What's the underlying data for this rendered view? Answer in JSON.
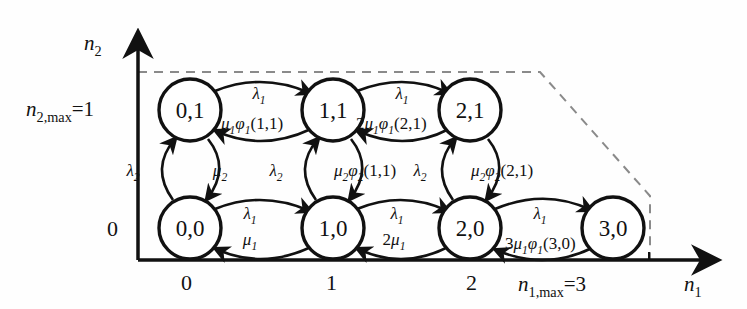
{
  "figure": {
    "type": "state-transition-diagram",
    "title": ""
  },
  "axes": {
    "x": {
      "name": "n1",
      "label": "n",
      "label_sub": "1",
      "ticks": [
        "0",
        "1",
        "2"
      ],
      "max_label_prefix": "n",
      "max_label_sub": "1,max",
      "max_label_value": "=3"
    },
    "y": {
      "name": "n2",
      "label": "n",
      "label_sub": "2",
      "ticks": [
        "0"
      ],
      "max_label_prefix": "n",
      "max_label_sub": "2,max",
      "max_label_value": "=1"
    }
  },
  "states": [
    {
      "id": "s00",
      "label": "0,0",
      "n1": 0,
      "n2": 0,
      "cx": 190,
      "cy": 228,
      "r": 31
    },
    {
      "id": "s10",
      "label": "1,0",
      "n1": 1,
      "n2": 0,
      "cx": 333,
      "cy": 228,
      "r": 31
    },
    {
      "id": "s20",
      "label": "2,0",
      "n1": 2,
      "n2": 0,
      "cx": 470,
      "cy": 228,
      "r": 31
    },
    {
      "id": "s30",
      "label": "3,0",
      "n1": 3,
      "n2": 0,
      "cx": 613,
      "cy": 228,
      "r": 31
    },
    {
      "id": "s01",
      "label": "0,1",
      "n1": 0,
      "n2": 1,
      "cx": 190,
      "cy": 110,
      "r": 31
    },
    {
      "id": "s11",
      "label": "1,1",
      "n1": 1,
      "n2": 1,
      "cx": 333,
      "cy": 110,
      "r": 31
    },
    {
      "id": "s21",
      "label": "2,1",
      "n1": 2,
      "n2": 1,
      "cx": 470,
      "cy": 110,
      "r": 31
    }
  ],
  "transitions": [
    {
      "id": "t-00-10",
      "from": "0,0",
      "to": "1,0",
      "rate": "λ",
      "rate_sub": "1",
      "x": 250,
      "y": 217
    },
    {
      "id": "t-10-00",
      "from": "1,0",
      "to": "0,0",
      "rate": "μ",
      "rate_sub": "1",
      "prefix": "",
      "x": 250,
      "y": 243
    },
    {
      "id": "t-10-20",
      "from": "1,0",
      "to": "2,0",
      "rate": "λ",
      "rate_sub": "1",
      "x": 395,
      "y": 217
    },
    {
      "id": "t-20-10",
      "from": "2,0",
      "to": "1,0",
      "rate": "μ",
      "rate_sub": "1",
      "prefix": "2",
      "x": 388,
      "y": 243
    },
    {
      "id": "t-20-30",
      "from": "2,0",
      "to": "3,0",
      "rate": "λ",
      "rate_sub": "1",
      "x": 538,
      "y": 217
    },
    {
      "id": "t-30-20",
      "from": "3,0",
      "to": "2,0",
      "rate": "3μ1φ1(3,0)",
      "prefix": "3",
      "x": 505,
      "y": 247
    },
    {
      "id": "t-01-11",
      "from": "0,1",
      "to": "1,1",
      "rate": "λ",
      "rate_sub": "1",
      "x": 254,
      "y": 96
    },
    {
      "id": "t-11-01",
      "from": "1,1",
      "to": "0,1",
      "rate": "μ1φ1(1,1)",
      "x": 221,
      "y": 127
    },
    {
      "id": "t-11-21",
      "from": "1,1",
      "to": "2,1",
      "rate": "λ",
      "rate_sub": "1",
      "x": 398,
      "y": 96
    },
    {
      "id": "t-21-11",
      "from": "2,1",
      "to": "1,1",
      "rate": "2μ1φ1(2,1)",
      "prefix": "2",
      "x": 357,
      "y": 127
    },
    {
      "id": "t-00-01",
      "from": "0,0",
      "to": "0,1",
      "rate": "λ",
      "rate_sub": "2",
      "x": 140,
      "y": 173
    },
    {
      "id": "t-01-00",
      "from": "0,1",
      "to": "0,0",
      "rate": "μ",
      "rate_sub": "2",
      "x": 216,
      "y": 173
    },
    {
      "id": "t-10-11",
      "from": "1,0",
      "to": "1,1",
      "rate": "λ",
      "rate_sub": "2",
      "x": 281,
      "y": 173
    },
    {
      "id": "t-11-10",
      "from": "1,1",
      "to": "1,0",
      "rate": "μ2φ2(1,1)",
      "x": 337,
      "y": 173
    },
    {
      "id": "t-20-21",
      "from": "2,0",
      "to": "2,1",
      "rate": "λ",
      "rate_sub": "2",
      "x": 424,
      "y": 173
    },
    {
      "id": "t-21-20",
      "from": "2,1",
      "to": "2,0",
      "rate": "μ2φ2(2,1)",
      "x": 474,
      "y": 173
    }
  ],
  "boundary": {
    "style": "dashed",
    "color": "#8a8a8a",
    "points": "138,72 540,72 650,196 650,260"
  },
  "colors": {
    "stroke": "#111111",
    "background": "#ffffff",
    "dashed": "#8a8a8a"
  }
}
